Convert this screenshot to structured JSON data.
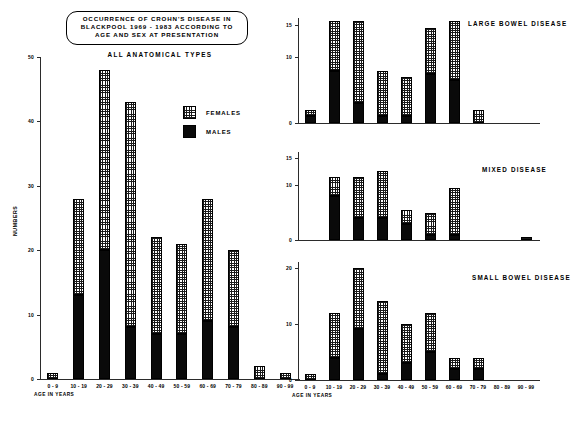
{
  "figure": {
    "title_lines": [
      "OCCURRENCE OF CROHN'S DISEASE IN",
      "BLACKPOOL 1969 - 1983 ACCORDING TO",
      "AGE AND SEX AT PRESENTATION"
    ],
    "legend": [
      {
        "label": "FEMALES",
        "swatch": "checkered-pattern",
        "color": "#ffffff"
      },
      {
        "label": "MALES",
        "swatch": "solid-black",
        "color": "#0a0a0a"
      }
    ],
    "axis_caption": "AGE IN YEARS",
    "y_axis_caption": "NUMBERS"
  },
  "chart_data": [
    {
      "type": "bar",
      "id": "all-anatomical-types",
      "title": "ALL ANATOMICAL TYPES",
      "stacked": true,
      "xlabel": "AGE IN YEARS",
      "ylabel": "NUMBERS",
      "categories": [
        "0 - 9",
        "10 - 19",
        "20 - 29",
        "30 - 39",
        "40 - 49",
        "50 - 59",
        "60 - 69",
        "70 - 79",
        "80 - 89",
        "90 - 99"
      ],
      "series": [
        {
          "name": "MALES",
          "values": [
            0,
            13,
            20,
            8,
            7,
            7,
            9,
            8,
            0,
            0
          ]
        },
        {
          "name": "FEMALES",
          "values": [
            1,
            15,
            28,
            35,
            15,
            14,
            19,
            12,
            2,
            1
          ]
        }
      ],
      "totals": [
        1,
        28,
        48,
        43,
        22,
        21,
        28,
        20,
        2,
        1
      ],
      "ylim": [
        0,
        50
      ],
      "yticks": [
        0,
        10,
        20,
        30,
        40,
        50
      ],
      "grid": false,
      "legend_position": "inside-right"
    },
    {
      "type": "bar",
      "id": "large-bowel-disease",
      "title": "LARGE BOWEL DISEASE",
      "stacked": true,
      "xlabel": "",
      "ylabel": "",
      "categories": [
        "0 - 9",
        "10 - 19",
        "20 - 29",
        "30 - 39",
        "40 - 49",
        "50 - 59",
        "60 - 69",
        "70 - 79",
        "80 - 89",
        "90 - 99"
      ],
      "series": [
        {
          "name": "MALES",
          "values": [
            1,
            8,
            3,
            1,
            1,
            7.5,
            6.5,
            0,
            0,
            0
          ]
        },
        {
          "name": "FEMALES",
          "values": [
            1,
            7.5,
            12.5,
            7,
            6,
            7,
            9,
            2,
            0,
            0
          ]
        }
      ],
      "totals": [
        2,
        15.5,
        15.5,
        8,
        7,
        14.5,
        15.5,
        2,
        0,
        0
      ],
      "ylim": [
        0,
        16
      ],
      "yticks": [
        0,
        10,
        15
      ],
      "grid": false
    },
    {
      "type": "bar",
      "id": "mixed-disease",
      "title": "MIXED DISEASE",
      "stacked": true,
      "xlabel": "",
      "ylabel": "",
      "categories": [
        "0 - 9",
        "10 - 19",
        "20 - 29",
        "30 - 39",
        "40 - 49",
        "50 - 59",
        "60 - 69",
        "70 - 79",
        "80 - 89",
        "90 - 99"
      ],
      "series": [
        {
          "name": "MALES",
          "values": [
            0,
            8,
            4,
            4,
            3,
            1,
            1,
            0,
            0,
            0
          ]
        },
        {
          "name": "FEMALES",
          "values": [
            0,
            3.5,
            7.5,
            8.5,
            2.5,
            4,
            8.5,
            0,
            0,
            0.5
          ]
        }
      ],
      "totals": [
        0,
        11.5,
        11.5,
        12.5,
        5.5,
        5,
        9.5,
        0,
        0,
        0.5
      ],
      "ylim": [
        0,
        16
      ],
      "yticks": [
        0,
        10,
        15
      ],
      "grid": false
    },
    {
      "type": "bar",
      "id": "small-bowel-disease",
      "title": "SMALL BOWEL DISEASE",
      "stacked": true,
      "xlabel": "AGE IN YEARS",
      "ylabel": "",
      "categories": [
        "0 - 9",
        "10 - 19",
        "20 - 29",
        "30 - 39",
        "40 - 49",
        "50 - 59",
        "60 - 69",
        "70 - 79",
        "80 - 89",
        "90 - 99"
      ],
      "series": [
        {
          "name": "MALES",
          "values": [
            0,
            4,
            9,
            1,
            3,
            5,
            2,
            2,
            0,
            0
          ]
        },
        {
          "name": "FEMALES",
          "values": [
            1,
            8,
            11,
            13,
            7,
            7,
            2,
            2,
            0,
            0
          ]
        }
      ],
      "totals": [
        1,
        12,
        20,
        14,
        10,
        12,
        4,
        4,
        0,
        0
      ],
      "ylim": [
        0,
        21
      ],
      "yticks": [
        0,
        10,
        20
      ],
      "grid": false
    }
  ]
}
